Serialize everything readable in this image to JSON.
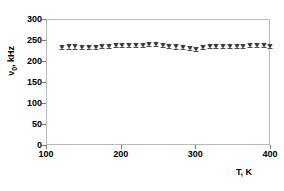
{
  "chart_data": {
    "type": "scatter",
    "title": "",
    "subtitle": "",
    "xlabel": "T, K",
    "ylabel": "ν0, kHz",
    "ylabel_main": "ν",
    "ylabel_sub": "0",
    "ylabel_tail": ", kHz",
    "xlim": [
      100,
      400
    ],
    "ylim": [
      0,
      300
    ],
    "xticks": [
      100,
      200,
      300,
      400
    ],
    "yticks": [
      0,
      50,
      100,
      150,
      200,
      250,
      300
    ],
    "xtick_labels": [
      "100",
      "200",
      "300",
      "400"
    ],
    "ytick_labels": [
      "0",
      "50",
      "100",
      "150",
      "200",
      "250",
      "300"
    ],
    "grid": false,
    "legend": "none",
    "marker": "diamond",
    "marker_color": "#3a3a3a",
    "errorbar_color": "#4d4d4d",
    "frame_color": "#b9b9b9",
    "background": "#ffffff",
    "has_error_bars": true,
    "series": [
      {
        "name": "nu0",
        "x": [
          120,
          129,
          138,
          147,
          156,
          165,
          174,
          183,
          192,
          201,
          210,
          219,
          228,
          237,
          246,
          255,
          264,
          273,
          282,
          291,
          300,
          309,
          318,
          327,
          336,
          345,
          354,
          363,
          372,
          381,
          390,
          399
        ],
        "y": [
          236,
          237,
          237,
          236,
          235,
          236,
          238,
          239,
          240,
          241,
          241,
          240,
          241,
          242,
          243,
          240,
          238,
          237,
          236,
          233,
          231,
          236,
          238,
          238,
          238,
          239,
          239,
          239,
          240,
          240,
          240,
          239
        ],
        "yerr": [
          5,
          5,
          5,
          5,
          5,
          5,
          5,
          5,
          5,
          5,
          5,
          5,
          5,
          5,
          5,
          5,
          5,
          5,
          5,
          5,
          5,
          5,
          5,
          5,
          5,
          5,
          5,
          5,
          5,
          5,
          5,
          5
        ]
      }
    ]
  }
}
